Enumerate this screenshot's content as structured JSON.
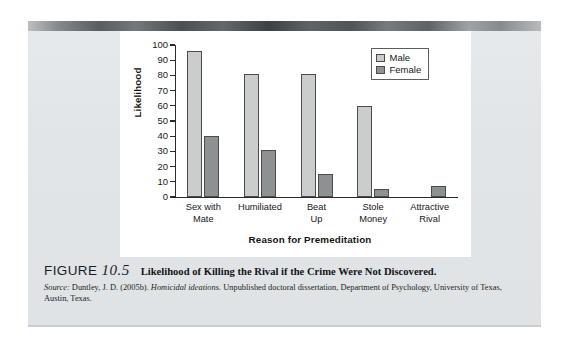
{
  "figure": {
    "label_word": "FIGURE",
    "number": "10.5",
    "title": "Likelihood of Killing the Rival if the Crime Were Not Discovered.",
    "source_prefix": "Source:",
    "source_text_1": " Duntley, J. D. (2005b). ",
    "source_italic": "Homicidal ideations.",
    "source_text_2": " Unpublished doctoral dissertation, Department of Psychology, University of Texas, Austin, Texas."
  },
  "legend": {
    "position": "top-right",
    "items": [
      {
        "label": "Male",
        "color": "#cbcdcd",
        "swatch": "male-swatch"
      },
      {
        "label": "Female",
        "color": "#8e9192",
        "swatch": "female-swatch"
      }
    ]
  },
  "chart_data": {
    "type": "bar",
    "title": "Likelihood of Killing the Rival if the Crime Were Not Discovered.",
    "xlabel": "Reason for Premeditation",
    "ylabel": "Likelihood",
    "ylim": [
      0,
      100
    ],
    "yticks": [
      0,
      10,
      20,
      30,
      40,
      50,
      60,
      70,
      80,
      90,
      100
    ],
    "ytick_labels": [
      "0",
      "10",
      "20",
      "30",
      "40",
      "50",
      "60",
      "70",
      "80",
      "90",
      "100"
    ],
    "grid": false,
    "legend": [
      "Male",
      "Female"
    ],
    "categories": [
      "Sex with\nMate",
      "Humiliated",
      "Beat\nUp",
      "Stole\nMoney",
      "Attractive\nRival"
    ],
    "series": [
      {
        "name": "Male",
        "color": "#cbcdcd",
        "values": [
          96,
          81,
          81,
          60,
          0
        ]
      },
      {
        "name": "Female",
        "color": "#8e9192",
        "values": [
          40,
          31,
          15,
          5,
          7
        ]
      }
    ]
  }
}
